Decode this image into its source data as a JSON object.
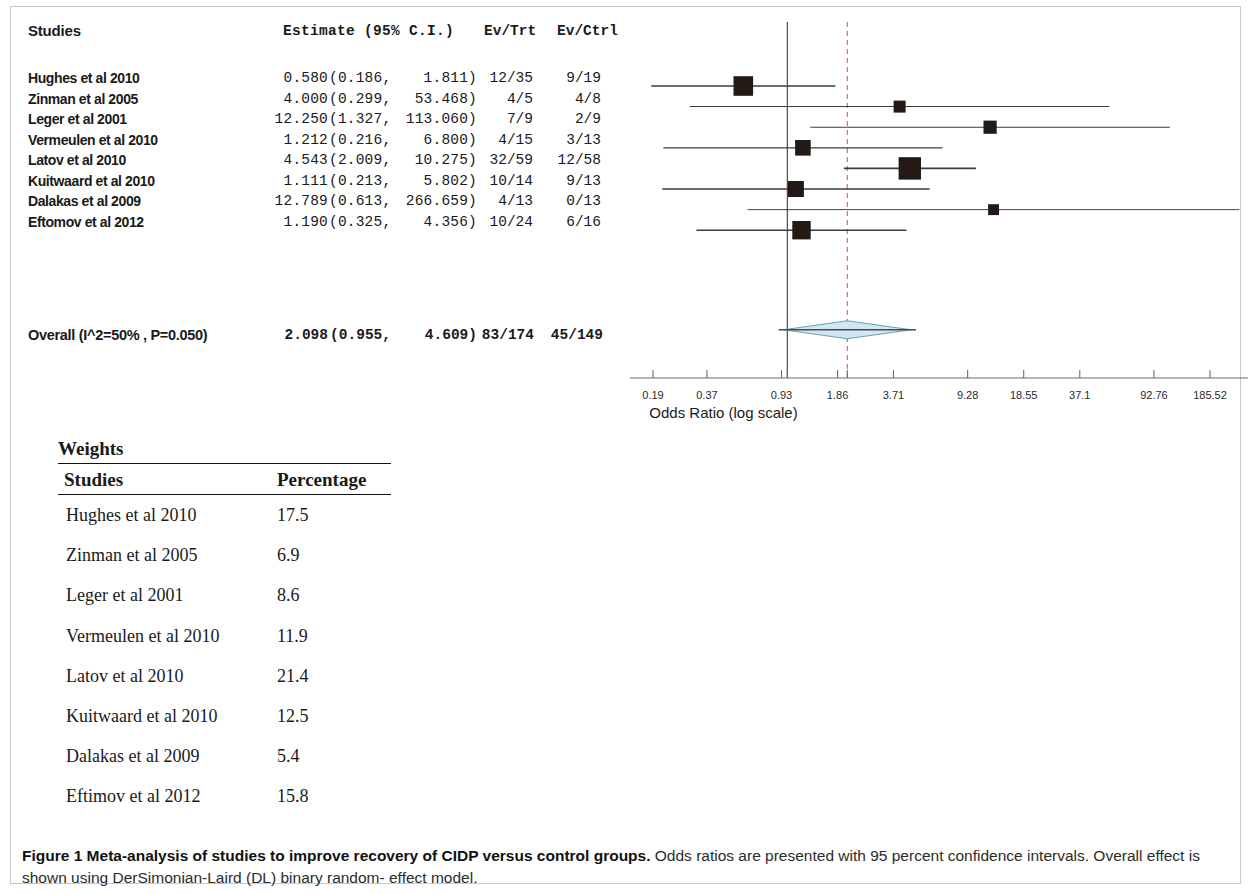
{
  "figure": {
    "caption_bold": "Figure 1 Meta-analysis of studies to improve recovery of CIDP versus control groups.",
    "caption_rest": " Odds ratios are presented with 95 percent confidence intervals. Overall effect is shown using DerSimonian-Laird (DL) binary random- effect model."
  },
  "forest_table": {
    "headers": {
      "studies": "Studies",
      "estimate": "Estimate (95% C.I.)",
      "ev_trt": "Ev/Trt",
      "ev_ctrl": "Ev/Ctrl"
    },
    "rows": [
      {
        "study": "Hughes et al  2010",
        "estimate": "0.580",
        "lower": "(0.186,",
        "upper": "1.811)",
        "ev_trt": "12/35",
        "ev_ctrl": "9/19"
      },
      {
        "study": "Zinman et al 2005",
        "estimate": "4.000",
        "lower": "(0.299,",
        "upper": "53.468)",
        "ev_trt": "4/5",
        "ev_ctrl": "4/8"
      },
      {
        "study": "Leger et al 2001",
        "estimate": "12.250",
        "lower": "(1.327,",
        "upper": "113.060)",
        "ev_trt": "7/9",
        "ev_ctrl": "2/9"
      },
      {
        "study": "Vermeulen et al 2010",
        "estimate": "1.212",
        "lower": "(0.216,",
        "upper": "6.800)",
        "ev_trt": "4/15",
        "ev_ctrl": "3/13"
      },
      {
        "study": "Latov et al 2010",
        "estimate": "4.543",
        "lower": "(2.009,",
        "upper": "10.275)",
        "ev_trt": "32/59",
        "ev_ctrl": "12/58"
      },
      {
        "study": "Kuitwaard et al 2010",
        "estimate": "1.111",
        "lower": "(0.213,",
        "upper": "5.802)",
        "ev_trt": "10/14",
        "ev_ctrl": "9/13"
      },
      {
        "study": "Dalakas et al 2009",
        "estimate": "12.789",
        "lower": "(0.613,",
        "upper": "266.659)",
        "ev_trt": "4/13",
        "ev_ctrl": "0/13"
      },
      {
        "study": "Eftomov et al 2012",
        "estimate": "1.190",
        "lower": "(0.325,",
        "upper": "4.356)",
        "ev_trt": "10/24",
        "ev_ctrl": "6/16"
      }
    ],
    "overall": {
      "study": "Overall (I^2=50% , P=0.050)",
      "estimate": "2.098",
      "lower": "(0.955,",
      "upper": "4.609)",
      "ev_trt": "83/174",
      "ev_ctrl": "45/149"
    }
  },
  "weights_table": {
    "title": "Weights",
    "headers": {
      "studies": "Studies",
      "percentage": "Percentage"
    },
    "rows": [
      {
        "study": "Hughes et al 2010",
        "percentage": "17.5"
      },
      {
        "study": "Zinman et al 2005",
        "percentage": "6.9"
      },
      {
        "study": "Leger et al 2001",
        "percentage": "8.6"
      },
      {
        "study": "Vermeulen et al 2010",
        "percentage": "11.9"
      },
      {
        "study": "Latov et al 2010",
        "percentage": "21.4"
      },
      {
        "study": "Kuitwaard et al 2010",
        "percentage": "12.5"
      },
      {
        "study": "Dalakas et al 2009",
        "percentage": "5.4"
      },
      {
        "study": "Eftimov et al 2012",
        "percentage": "15.8"
      }
    ]
  },
  "chart_data": {
    "type": "forest",
    "title": "",
    "xlabel": "Odds Ratio (log scale)",
    "ylabel": "",
    "xscale": "log",
    "xlim": [
      0.15,
      230
    ],
    "grid": false,
    "legend": null,
    "tick_labels": [
      "0.19",
      "0.37",
      "0.93",
      "1.86",
      "3.71",
      "9.28",
      "18.55",
      "37.1",
      "92.76",
      "185.52"
    ],
    "tick_values": [
      0.19,
      0.37,
      0.93,
      1.86,
      3.71,
      9.28,
      18.55,
      37.1,
      92.76,
      185.52
    ],
    "reference_line": {
      "value": 1.0,
      "color": "#555555",
      "style": "solid"
    },
    "pooled_line": {
      "value": 2.098,
      "color": "#e06666",
      "style": "dashed"
    },
    "marker_color": "#231a16",
    "diamond_fill": "#cfe8f3",
    "diamond_stroke": "#6f9fb5",
    "studies": [
      {
        "label": "Hughes et al  2010",
        "or": 0.58,
        "ci_low": 0.186,
        "ci_high": 1.811,
        "weight": 17.5
      },
      {
        "label": "Zinman et al 2005",
        "or": 4.0,
        "ci_low": 0.299,
        "ci_high": 53.468,
        "weight": 6.9
      },
      {
        "label": "Leger et al 2001",
        "or": 12.25,
        "ci_low": 1.327,
        "ci_high": 113.06,
        "weight": 8.6
      },
      {
        "label": "Vermeulen et al 2010",
        "or": 1.212,
        "ci_low": 0.216,
        "ci_high": 6.8,
        "weight": 11.9
      },
      {
        "label": "Latov et al 2010",
        "or": 4.543,
        "ci_low": 2.009,
        "ci_high": 10.275,
        "weight": 21.4
      },
      {
        "label": "Kuitwaard et al 2010",
        "or": 1.111,
        "ci_low": 0.213,
        "ci_high": 5.802,
        "weight": 12.5
      },
      {
        "label": "Dalakas et al 2009",
        "or": 12.789,
        "ci_low": 0.613,
        "ci_high": 266.659,
        "weight": 5.4
      },
      {
        "label": "Eftomov et al 2012",
        "or": 1.19,
        "ci_low": 0.325,
        "ci_high": 4.356,
        "weight": 15.8
      }
    ],
    "overall": {
      "label": "Overall (I^2=50% , P=0.050)",
      "or": 2.098,
      "ci_low": 0.955,
      "ci_high": 4.609,
      "i_squared": "50%",
      "p_value": "0.050",
      "ev_trt": "83/174",
      "ev_ctrl": "45/149"
    }
  }
}
